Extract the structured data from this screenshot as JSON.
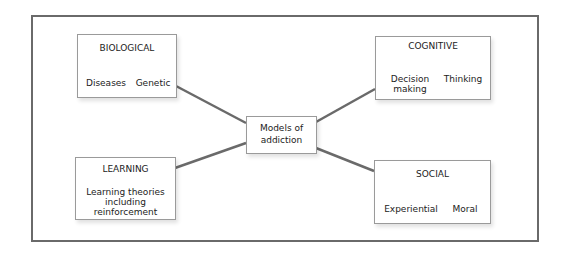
{
  "diagram": {
    "center": {
      "label_line1": "Models of",
      "label_line2": "addiction"
    },
    "nodes": {
      "biological": {
        "title": "BIOLOGICAL",
        "children": [
          "Diseases",
          "Genetic"
        ]
      },
      "cognitive": {
        "title": "COGNITIVE",
        "children": [
          [
            "Decision",
            "making"
          ],
          "Thinking"
        ]
      },
      "learning": {
        "title": "LEARNING",
        "children": [
          [
            "Learning theories",
            "including",
            "reinforcement"
          ]
        ]
      },
      "social": {
        "title": "SOCIAL",
        "children": [
          "Experiential",
          "Moral"
        ]
      }
    },
    "colors": {
      "connector": "#6a6a6a",
      "frame": "#6a6a6a",
      "box_border": "#9a9a9a"
    }
  }
}
